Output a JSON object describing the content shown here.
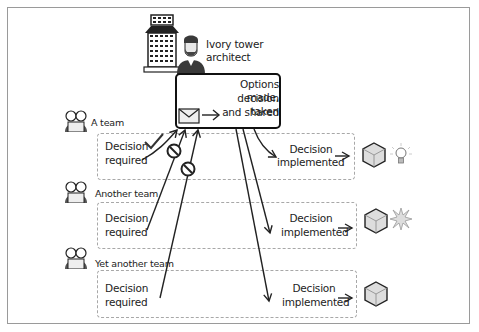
{
  "architect": {
    "label_line1": "Ivory tower",
    "label_line2": "architect",
    "box_line1": "Options made,",
    "box_line2": "decision taken",
    "box_line3": "and shared",
    "icons": [
      "tower-icon",
      "architect-avatar-icon",
      "envelope-icon"
    ]
  },
  "teams": [
    {
      "name": "A team",
      "required_line1": "Decision",
      "required_line2": "required",
      "implemented_line1": "Decision",
      "implemented_line2": "implemented",
      "outcome_icon": "lightbulb-icon"
    },
    {
      "name": "Another team",
      "required_line1": "Decision",
      "required_line2": "required",
      "implemented_line1": "Decision",
      "implemented_line2": "implemented",
      "outcome_icon": "explosion-icon"
    },
    {
      "name": "Yet another team",
      "required_line1": "Decision",
      "required_line2": "required",
      "implemented_line1": "Decision",
      "implemented_line2": "implemented",
      "outcome_icon": "none"
    }
  ],
  "colors": {
    "frame": "#9a9a9a",
    "dashed": "#a8a8a8",
    "ink": "#222222",
    "cube": "#d8d8d8"
  }
}
